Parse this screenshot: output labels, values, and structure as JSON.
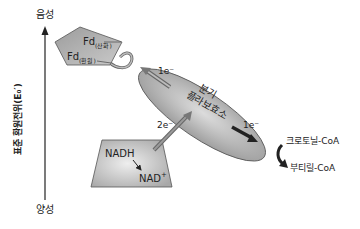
{
  "axis": {
    "top_label": "음성",
    "bottom_label": "양성",
    "title": "표준 환원전위(E₀′)"
  },
  "ferredoxin": {
    "oxidized_base": "Fd",
    "oxidized_sub": "(산화)",
    "reduced_base": "Fd",
    "reduced_sub": "(환원)"
  },
  "flavoenzyme": {
    "line1": "분기",
    "line2": "플라보효소",
    "electron_up": "1e⁻",
    "electron_down": "1e⁻"
  },
  "nadh_box": {
    "nadh": "NADH",
    "nad_base": "NAD",
    "nad_sup": "+",
    "transfer_label": "2e⁻"
  },
  "acceptor": {
    "crotonyl": "크로토닐-CoA",
    "butyryl": "부티릴-CoA"
  },
  "colors": {
    "shape_fill": "#b5b5b5",
    "shape_stroke": "#555555",
    "arrow_dark": "#222222",
    "arrow_gray": "#888888"
  }
}
